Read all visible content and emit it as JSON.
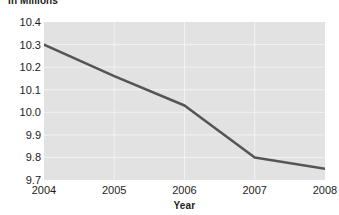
{
  "chart_data": {
    "type": "line",
    "title": "In Millions",
    "xlabel": "Year",
    "ylabel": "",
    "x": [
      2004,
      2005,
      2006,
      2007,
      2008
    ],
    "xtick_labels": [
      "2004",
      "2005",
      "2006",
      "2007",
      "2008"
    ],
    "ytick_labels": [
      "10.4",
      "10.3",
      "10.2",
      "10.1",
      "10.0",
      "9.9",
      "9.8",
      "9.7"
    ],
    "ytick_values": [
      10.4,
      10.3,
      10.2,
      10.1,
      10.0,
      9.9,
      9.8,
      9.7
    ],
    "xlim": [
      2004,
      2008
    ],
    "ylim": [
      9.7,
      10.4
    ],
    "grid": true,
    "legend": "none",
    "series": [
      {
        "name": "Population",
        "values": [
          10.3,
          10.16,
          10.03,
          9.8,
          9.75
        ]
      }
    ],
    "plot_background_color": "#e2e2e2",
    "gridline_color": "#f2f2f2",
    "line_color": "#555555",
    "text_color": "#1c1c1c"
  }
}
